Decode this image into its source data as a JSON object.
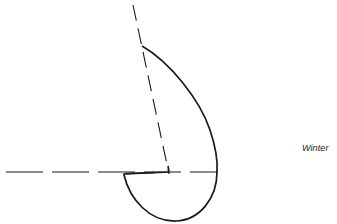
{
  "diagram": {
    "label": "Winter",
    "colors": {
      "line": "#1a1a1a",
      "background": "#ffffff"
    },
    "axes": {
      "horizontal": {
        "x1": 6,
        "y1": 172,
        "x2": 218,
        "y2": 172,
        "style": "dashed"
      },
      "slanted": {
        "x1": 133,
        "y1": 5,
        "x2": 169,
        "y2": 174,
        "style": "dashed"
      }
    },
    "center": {
      "x": 169,
      "y": 172
    },
    "curve": {
      "shape": "teardrop polar plot",
      "start": {
        "x": 142,
        "y": 46
      },
      "rightmost": {
        "x": 217,
        "y": 172
      },
      "bottom": {
        "x": 176,
        "y": 221
      },
      "end": {
        "x": 124,
        "y": 174
      }
    }
  }
}
